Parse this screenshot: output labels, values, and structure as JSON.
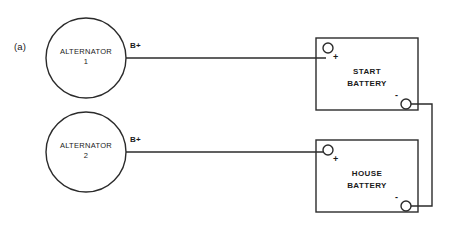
{
  "figure": {
    "panel_label": "(a)",
    "stroke_color": "#2b2b2b",
    "background_color": "#ffffff"
  },
  "alternators": [
    {
      "name": "alternator-1",
      "line1": "ALTERNATOR",
      "line2": "1",
      "terminal_label": "B+"
    },
    {
      "name": "alternator-2",
      "line1": "ALTERNATOR",
      "line2": "2",
      "terminal_label": "B+"
    }
  ],
  "batteries": [
    {
      "name": "start-battery",
      "line1": "START",
      "line2": "BATTERY",
      "positive_sign": "+",
      "negative_sign": "-"
    },
    {
      "name": "house-battery",
      "line1": "HOUSE",
      "line2": "BATTERY",
      "positive_sign": "+",
      "negative_sign": "-"
    }
  ]
}
